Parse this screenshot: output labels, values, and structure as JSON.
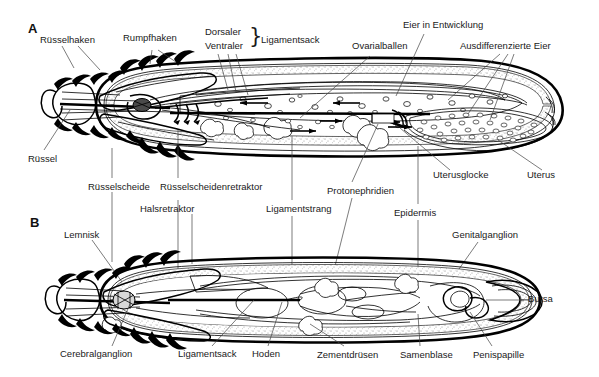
{
  "figure": {
    "kind": "anatomical-diagram",
    "language": "de"
  },
  "panels": [
    {
      "id": "A",
      "letter": "A",
      "sex": "weiblich"
    },
    {
      "id": "B",
      "letter": "B",
      "sex": "maennlich"
    }
  ],
  "panel_a": {
    "letter": "A",
    "labels": [
      {
        "name": "ruesselhaken",
        "text": "Rüsselhaken",
        "x": 40,
        "y": 34
      },
      {
        "name": "rumpfhaken",
        "text": "Rumpfhaken",
        "x": 123,
        "y": 39
      },
      {
        "name": "dorsaler",
        "text": "Dorsaler",
        "x": 205,
        "y": 32
      },
      {
        "name": "ventraler",
        "text": "Ventraler",
        "x": 205,
        "y": 45
      },
      {
        "name": "ligamentsack",
        "text": "Ligamentsack",
        "x": 248,
        "y": 39
      },
      {
        "name": "ovarialballen",
        "text": "Ovarialballen",
        "x": 352,
        "y": 45
      },
      {
        "name": "eier-in-entwicklung",
        "text": "Eier in Entwicklung",
        "x": 403,
        "y": 24
      },
      {
        "name": "ausdifferenzierte-eier",
        "text": "Ausdifferenzierte Eier",
        "x": 460,
        "y": 44
      },
      {
        "name": "ruessel",
        "text": "Rüssel",
        "x": 28,
        "y": 157
      },
      {
        "name": "uterusglocke",
        "text": "Uterusglocke",
        "x": 433,
        "y": 174
      },
      {
        "name": "uterus",
        "text": "Uterus",
        "x": 527,
        "y": 174
      }
    ],
    "brace": "}"
  },
  "panel_mid": {
    "labels": [
      {
        "name": "ruesselscheide",
        "text": "Rüsselscheide",
        "x": 88,
        "y": 186
      },
      {
        "name": "ruesselscheidenretraktor",
        "text": "Rüsselscheidenretraktor",
        "x": 160,
        "y": 186
      },
      {
        "name": "halsretraktor",
        "text": "Halsretraktor",
        "x": 140,
        "y": 208
      },
      {
        "name": "ligamentstrang",
        "text": "Ligamentstrang",
        "x": 266,
        "y": 208
      },
      {
        "name": "protonephridien",
        "text": "Protonephridien",
        "x": 327,
        "y": 190
      },
      {
        "name": "epidermis",
        "text": "Epidermis",
        "x": 394,
        "y": 212
      },
      {
        "name": "genitalganglion",
        "text": "Genitalganglion",
        "x": 452,
        "y": 234
      },
      {
        "name": "lemnisk",
        "text": "Lemnisk",
        "x": 64,
        "y": 234
      }
    ]
  },
  "panel_b": {
    "letter": "B",
    "labels": [
      {
        "name": "bursa",
        "text": "Bursa",
        "x": 528,
        "y": 297
      },
      {
        "name": "cerebralganglion",
        "text": "Cerebralganglion",
        "x": 60,
        "y": 352
      },
      {
        "name": "ligamentsack",
        "text": "Ligamentsack",
        "x": 178,
        "y": 352
      },
      {
        "name": "hoden",
        "text": "Hoden",
        "x": 252,
        "y": 352
      },
      {
        "name": "zementdruesen",
        "text": "Zementdrüsen",
        "x": 317,
        "y": 353
      },
      {
        "name": "samenblase",
        "text": "Samenblase",
        "x": 400,
        "y": 353
      },
      {
        "name": "penispapille",
        "text": "Penispapille",
        "x": 473,
        "y": 353
      }
    ]
  },
  "colors": {
    "ink": "#000000",
    "leader": "#444444",
    "paper": "#ffffff",
    "tissue_fill": "#f2f2f2"
  }
}
